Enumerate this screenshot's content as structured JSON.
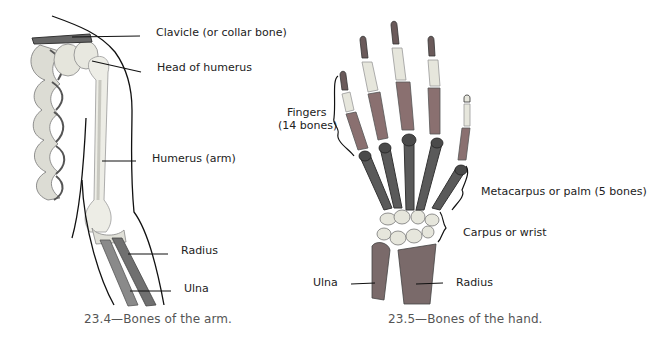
{
  "figures": [
    {
      "id": "arm",
      "caption": "23.4—Bones of the arm.",
      "labels": {
        "clavicle": "Clavicle (or collar bone)",
        "head_of_humerus": "Head of humerus",
        "humerus": "Humerus (arm)",
        "radius": "Radius",
        "ulna": "Ulna"
      }
    },
    {
      "id": "hand",
      "caption": "23.5—Bones of the hand.",
      "labels": {
        "fingers_line1": "Fingers",
        "fingers_line2": "(14 bones)",
        "metacarpus": "Metacarpus or palm (5 bones)",
        "carpus": "Carpus or wrist",
        "ulna": "Ulna",
        "radius": "Radius"
      }
    }
  ],
  "colors": {
    "bone_light": "#e8e8e0",
    "bone_mid": "#a8a8a8",
    "bone_dark": "#555555",
    "bone_red": "#8a6a6a",
    "outline": "#111111",
    "caption": "#555555"
  }
}
